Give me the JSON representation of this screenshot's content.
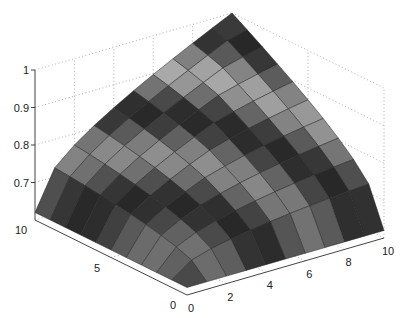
{
  "chart_data": {
    "type": "surface",
    "title": "",
    "xlabel": "",
    "ylabel": "",
    "zlabel": "",
    "x": [
      0,
      1,
      2,
      3,
      4,
      5,
      6,
      7,
      8,
      9,
      10
    ],
    "y": [
      0,
      1,
      2,
      3,
      4,
      5,
      6,
      7,
      8,
      9,
      10
    ],
    "z_formula": "0.62 + 0.38*(x*y/100)^0.5 approx; peak 1 at (10,10), min ~0.62 at (0,10) and (10,0)",
    "xlim": [
      0,
      10
    ],
    "ylim": [
      0,
      10
    ],
    "zlim": [
      0.6,
      1
    ],
    "x_ticks": [
      "0",
      "2",
      "4",
      "6",
      "8",
      "10"
    ],
    "y_ticks": [
      "0",
      "5",
      "10"
    ],
    "z_ticks": [
      "0.7",
      "0.8",
      "0.9",
      "1"
    ],
    "grid": true,
    "colormap": "gray"
  }
}
